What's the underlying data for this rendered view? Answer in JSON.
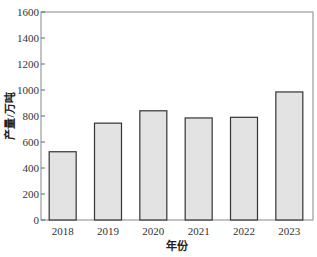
{
  "chart_data": {
    "type": "bar",
    "title": "",
    "xlabel": "年份",
    "ylabel": "产量/万吨",
    "categories": [
      "2018",
      "2019",
      "2020",
      "2021",
      "2022",
      "2023"
    ],
    "values": [
      525,
      745,
      840,
      785,
      790,
      985
    ],
    "ylim": [
      0,
      1600
    ],
    "yticks": [
      0,
      200,
      400,
      600,
      800,
      1000,
      1200,
      1400,
      1600
    ],
    "grid": false,
    "legend": null,
    "bar_color": "#e3e3e3",
    "bar_edge_color": "#333333"
  }
}
